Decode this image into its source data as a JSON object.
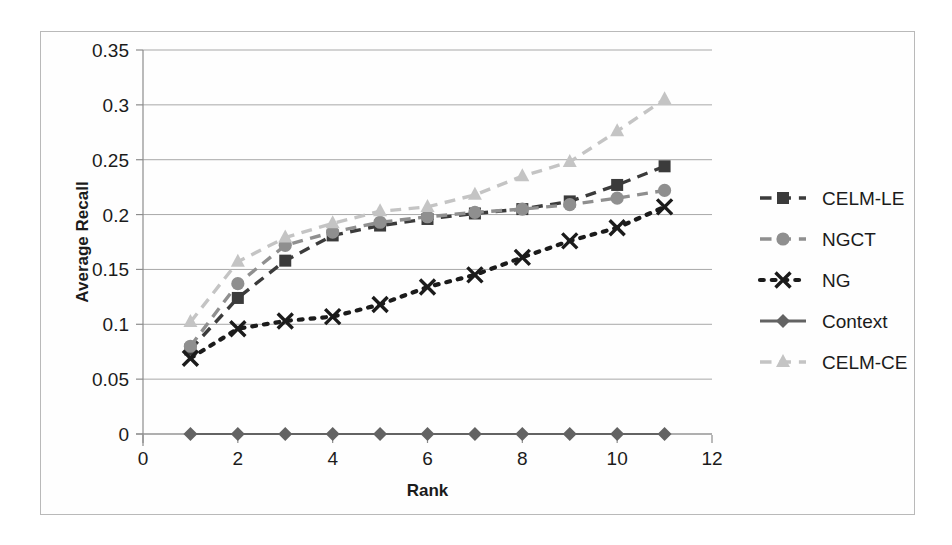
{
  "chart_data": {
    "type": "line",
    "title": "",
    "xlabel": "Rank",
    "ylabel": "Average Recall",
    "xlim": [
      0,
      12
    ],
    "ylim": [
      0,
      0.35
    ],
    "xticks": [
      "0",
      "2",
      "4",
      "6",
      "8",
      "10",
      "12"
    ],
    "xtick_values": [
      0,
      2,
      4,
      6,
      8,
      10,
      12
    ],
    "yticks": [
      "0",
      "0.05",
      "0.1",
      "0.15",
      "0.2",
      "0.25",
      "0.3",
      "0.35"
    ],
    "ytick_values": [
      0,
      0.05,
      0.1,
      0.15,
      0.2,
      0.25,
      0.3,
      0.35
    ],
    "grid": "horizontal",
    "legend_position": "right",
    "x": [
      1,
      2,
      3,
      4,
      5,
      6,
      7,
      8,
      9,
      10,
      11
    ],
    "series": [
      {
        "name": "CELM-LE",
        "marker": "square",
        "line": "dashed",
        "color": "#3b3b3b",
        "values": [
          0.077,
          0.124,
          0.158,
          0.181,
          0.19,
          0.196,
          0.201,
          0.205,
          0.212,
          0.227,
          0.244
        ]
      },
      {
        "name": "NGCT",
        "marker": "circle",
        "line": "dashed",
        "color": "#8f8f8f",
        "values": [
          0.08,
          0.137,
          0.172,
          0.184,
          0.193,
          0.198,
          0.202,
          0.205,
          0.209,
          0.215,
          0.222
        ]
      },
      {
        "name": "NG",
        "marker": "x",
        "line": "dotted",
        "color": "#1b1b1b",
        "values": [
          0.069,
          0.096,
          0.103,
          0.107,
          0.118,
          0.134,
          0.145,
          0.161,
          0.176,
          0.188,
          0.207
        ]
      },
      {
        "name": "Context",
        "marker": "diamond",
        "line": "solid",
        "color": "#636363",
        "values": [
          0.0,
          0.0,
          0.0,
          0.0,
          0.0,
          0.0,
          0.0,
          0.0,
          0.0,
          0.0,
          0.0
        ]
      },
      {
        "name": "CELM-CE",
        "marker": "triangle",
        "line": "dashed",
        "color": "#c4c4c4",
        "values": [
          0.102,
          0.157,
          0.179,
          0.192,
          0.203,
          0.207,
          0.218,
          0.235,
          0.248,
          0.276,
          0.305
        ]
      }
    ]
  },
  "legend": {
    "items": [
      {
        "label": "CELM-LE"
      },
      {
        "label": "NGCT"
      },
      {
        "label": "NG"
      },
      {
        "label": "Context"
      },
      {
        "label": "CELM-CE"
      }
    ]
  },
  "axes": {
    "x_title": "Rank",
    "y_title": "Average Recall"
  }
}
